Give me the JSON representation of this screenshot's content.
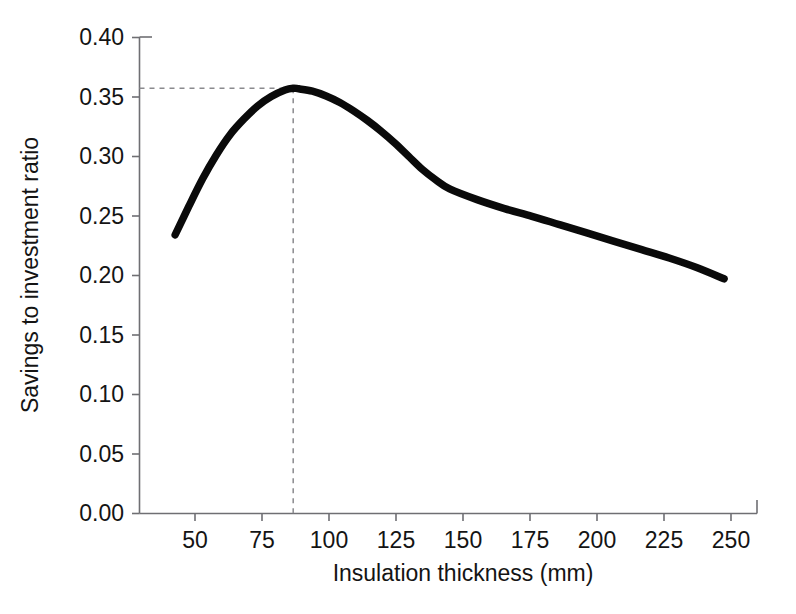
{
  "chart_data": {
    "type": "line",
    "title": "",
    "xlabel": "Insulation thickness (mm)",
    "ylabel": "Savings to investment ratio",
    "xlim": [
      37,
      262
    ],
    "ylim": [
      0.0,
      0.4
    ],
    "grid": false,
    "legend": "none",
    "xticks": [
      50,
      75,
      100,
      125,
      150,
      175,
      200,
      225,
      250
    ],
    "xtick_labels": [
      "50",
      "75",
      "100",
      "125",
      "150",
      "175",
      "200",
      "225",
      "250"
    ],
    "yticks": [
      0.0,
      0.05,
      0.1,
      0.15,
      0.2,
      0.25,
      0.3,
      0.35,
      0.4
    ],
    "ytick_labels": [
      "0.00",
      "0.05",
      "0.10",
      "0.15",
      "0.20",
      "0.25",
      "0.30",
      "0.35",
      "0.40"
    ],
    "series": [
      {
        "name": "Savings to investment ratio",
        "color": "#0a0a0a",
        "x": [
          50,
          55,
          60,
          65,
          70,
          75,
          80,
          85,
          90,
          93,
          95,
          100,
          105,
          110,
          115,
          120,
          125,
          130,
          135,
          140,
          145,
          150,
          160,
          170,
          180,
          190,
          200,
          210,
          220,
          230,
          240,
          250
        ],
        "y": [
          0.234,
          0.258,
          0.281,
          0.301,
          0.318,
          0.331,
          0.342,
          0.35,
          0.3555,
          0.357,
          0.3565,
          0.3545,
          0.3505,
          0.345,
          0.338,
          0.33,
          0.321,
          0.311,
          0.3,
          0.289,
          0.28,
          0.2725,
          0.2635,
          0.256,
          0.2495,
          0.2425,
          0.2355,
          0.2285,
          0.2215,
          0.2145,
          0.2065,
          0.197
        ]
      }
    ],
    "annotations": [
      {
        "name": "optimum-marker",
        "type": "crosshair",
        "x": 93,
        "y": 0.357,
        "style": "dashed",
        "color": "#8a8a8e",
        "label": ""
      }
    ]
  },
  "axes": {
    "y_title": "Savings to investment ratio",
    "x_title": "Insulation thickness (mm)"
  },
  "caption": {
    "text": ""
  }
}
